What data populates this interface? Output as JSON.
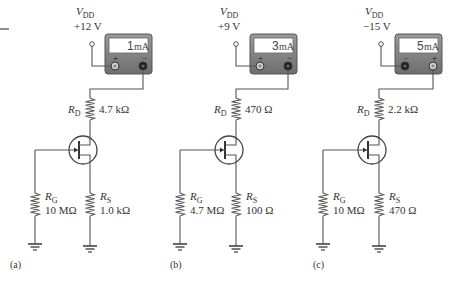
{
  "figure": {
    "type": "three JFET circuits with ammeters",
    "colors": {
      "wire": "#555555",
      "meter_body": "#7a7a7a",
      "meter_display": "#ffffff",
      "text": "#333333"
    },
    "circuits": [
      {
        "caption": "(a)",
        "vdd_label": "V",
        "vdd_sub": "DD",
        "vdd_value": "+12 V",
        "meter_reading": "1",
        "meter_unit": "mA",
        "meter_left_terminal": "+",
        "meter_right_terminal": "−",
        "rd_label": "R",
        "rd_sub": "D",
        "rd_value": "4.7 kΩ",
        "rg_label": "R",
        "rg_sub": "G",
        "rg_value": "10 MΩ",
        "rs_label": "R",
        "rs_sub": "S",
        "rs_value": "1.0 kΩ"
      },
      {
        "caption": "(b)",
        "vdd_label": "V",
        "vdd_sub": "DD",
        "vdd_value": "+9 V",
        "meter_reading": "3",
        "meter_unit": "mA",
        "meter_left_terminal": "+",
        "meter_right_terminal": "−",
        "rd_label": "R",
        "rd_sub": "D",
        "rd_value": "470 Ω",
        "rg_label": "R",
        "rg_sub": "G",
        "rg_value": "4.7 MΩ",
        "rs_label": "R",
        "rs_sub": "S",
        "rs_value": "100 Ω"
      },
      {
        "caption": "(c)",
        "vdd_label": "V",
        "vdd_sub": "DD",
        "vdd_value": "−15 V",
        "meter_reading": "5",
        "meter_unit": "mA",
        "meter_left_terminal": "−",
        "meter_right_terminal": "+",
        "rd_label": "R",
        "rd_sub": "D",
        "rd_value": "2.2 kΩ",
        "rg_label": "R",
        "rg_sub": "G",
        "rg_value": "10 MΩ",
        "rs_label": "R",
        "rs_sub": "S",
        "rs_value": "470 Ω"
      }
    ]
  }
}
